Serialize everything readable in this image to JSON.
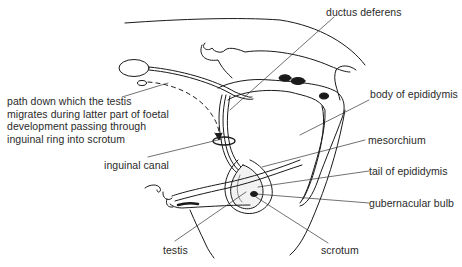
{
  "diagram": {
    "labels": {
      "ductus_deferens": "ductus deferens",
      "body_of_epididymis": "body of epididymis",
      "path_lines": [
        "path down which the testis",
        "migrates during latter part of foetal",
        "development passing through",
        "inguinal ring into scrotum"
      ],
      "inguinal_canal": "inguinal canal",
      "mesorchium": "mesorchium",
      "tail_of_epididymis": "tail of epididymis",
      "gubernacular_bulb": "gubernacular bulb",
      "testis": "testis",
      "scrotum": "scrotum"
    },
    "colors": {
      "ink": "#1a1a1a",
      "text": "#2a2a2a",
      "background": "#ffffff"
    }
  }
}
